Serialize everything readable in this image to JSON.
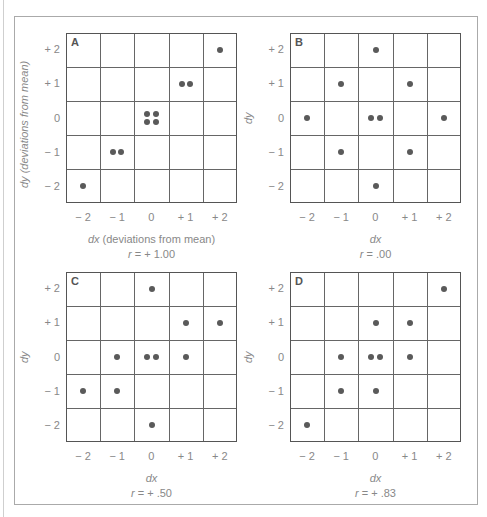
{
  "chart_data": [
    {
      "type": "scatter",
      "panel": "A",
      "title": "A",
      "xlabel": "dx (deviations from mean)",
      "ylabel": "dy (deviations from mean)",
      "caption": "r = + 1.00",
      "x_ticks": [
        "− 2",
        "− 1",
        "0",
        "+ 1",
        "+ 2"
      ],
      "y_ticks": [
        "+ 2",
        "+ 1",
        "0",
        "− 1",
        "− 2"
      ],
      "xlim": [
        -2.5,
        2.5
      ],
      "ylim": [
        -2.5,
        2.5
      ],
      "grid": true,
      "points": [
        {
          "x": -2,
          "y": -2
        },
        {
          "x": -1.12,
          "y": -1
        },
        {
          "x": -0.88,
          "y": -1
        },
        {
          "x": -0.12,
          "y": 0.12
        },
        {
          "x": 0.12,
          "y": 0.12
        },
        {
          "x": -0.12,
          "y": -0.12
        },
        {
          "x": 0.12,
          "y": -0.12
        },
        {
          "x": 0.88,
          "y": 1
        },
        {
          "x": 1.12,
          "y": 1
        },
        {
          "x": 2,
          "y": 2
        }
      ]
    },
    {
      "type": "scatter",
      "panel": "B",
      "title": "B",
      "xlabel": "dx",
      "ylabel": "dy",
      "caption": "r = .00",
      "x_ticks": [
        "− 2",
        "− 1",
        "0",
        "+ 1",
        "+ 2"
      ],
      "y_ticks": [
        "+ 2",
        "+ 1",
        "0",
        "− 1",
        "− 2"
      ],
      "xlim": [
        -2.5,
        2.5
      ],
      "ylim": [
        -2.5,
        2.5
      ],
      "grid": true,
      "points": [
        {
          "x": 0,
          "y": 2
        },
        {
          "x": -1,
          "y": 1
        },
        {
          "x": 1,
          "y": 1
        },
        {
          "x": -2,
          "y": 0
        },
        {
          "x": -0.12,
          "y": 0
        },
        {
          "x": 0.12,
          "y": 0
        },
        {
          "x": 2,
          "y": 0
        },
        {
          "x": -1,
          "y": -1
        },
        {
          "x": 1,
          "y": -1
        },
        {
          "x": 0,
          "y": -2
        }
      ]
    },
    {
      "type": "scatter",
      "panel": "C",
      "title": "C",
      "xlabel": "dx",
      "ylabel": "dy",
      "caption": "r = + .50",
      "x_ticks": [
        "− 2",
        "− 1",
        "0",
        "+ 1",
        "+ 2"
      ],
      "y_ticks": [
        "+ 2",
        "+ 1",
        "0",
        "− 1",
        "− 2"
      ],
      "xlim": [
        -2.5,
        2.5
      ],
      "ylim": [
        -2.5,
        2.5
      ],
      "grid": true,
      "points": [
        {
          "x": 0,
          "y": 2
        },
        {
          "x": 1,
          "y": 1
        },
        {
          "x": 2,
          "y": 1
        },
        {
          "x": -1,
          "y": 0
        },
        {
          "x": -0.12,
          "y": 0
        },
        {
          "x": 0.12,
          "y": 0
        },
        {
          "x": 1,
          "y": 0
        },
        {
          "x": -2,
          "y": -1
        },
        {
          "x": -1,
          "y": -1
        },
        {
          "x": 0,
          "y": -2
        }
      ]
    },
    {
      "type": "scatter",
      "panel": "D",
      "title": "D",
      "xlabel": "dx",
      "ylabel": "dy",
      "caption": "r = + .83",
      "x_ticks": [
        "− 2",
        "− 1",
        "0",
        "+ 1",
        "+ 2"
      ],
      "y_ticks": [
        "+ 2",
        "+ 1",
        "0",
        "− 1",
        "− 2"
      ],
      "xlim": [
        -2.5,
        2.5
      ],
      "ylim": [
        -2.5,
        2.5
      ],
      "grid": true,
      "points": [
        {
          "x": 2,
          "y": 2
        },
        {
          "x": 0,
          "y": 1
        },
        {
          "x": 1,
          "y": 1
        },
        {
          "x": -1,
          "y": 0
        },
        {
          "x": -0.12,
          "y": 0
        },
        {
          "x": 0.12,
          "y": 0
        },
        {
          "x": 1,
          "y": 0
        },
        {
          "x": -1,
          "y": -1
        },
        {
          "x": 0,
          "y": -1
        },
        {
          "x": -2,
          "y": -2
        }
      ]
    }
  ],
  "panels": [
    {
      "letter": "A",
      "ylabel": "dy (deviations from mean)",
      "xlabel_var": "dx",
      "xlabel_rest": " (deviations from mean)",
      "r_var": "r",
      "r_rest": " = + 1.00"
    },
    {
      "letter": "B",
      "ylabel": "dy",
      "xlabel_var": "dx",
      "xlabel_rest": "",
      "r_var": "r",
      "r_rest": " = .00"
    },
    {
      "letter": "C",
      "ylabel": "dy",
      "xlabel_var": "dx",
      "xlabel_rest": "",
      "r_var": "r",
      "r_rest": " = + .50"
    },
    {
      "letter": "D",
      "ylabel": "dy",
      "xlabel_var": "dx",
      "xlabel_rest": "",
      "r_var": "r",
      "r_rest": " = + .83"
    }
  ],
  "colors": {
    "dot": "#5a5a5a",
    "grid": "#666666",
    "text": "#888888"
  }
}
